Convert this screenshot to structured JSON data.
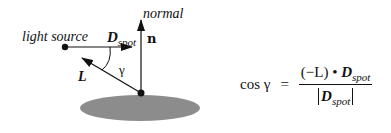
{
  "diagram": {
    "labels": {
      "light_source": "light source",
      "normal": "normal",
      "d_main": "D",
      "d_sub": "spot",
      "n": "n",
      "gamma": "γ",
      "L": "L"
    },
    "colors": {
      "ink": "#111111",
      "surface": "#8c8c8c",
      "background": "#ffffff"
    }
  },
  "formula": {
    "lhs": "cos γ",
    "equals": "=",
    "numerator_prefix": "(−L) • ",
    "numerator_d": "D",
    "numerator_sub": "spot",
    "denominator_d": "D",
    "denominator_sub": "spot"
  }
}
